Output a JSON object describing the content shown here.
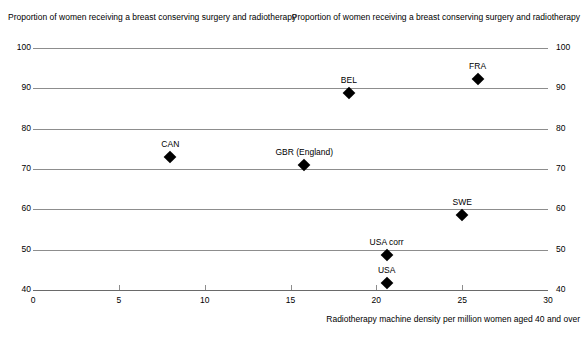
{
  "chart_data": {
    "type": "scatter",
    "title": "",
    "xlabel": "Radiotherapy machine density per million women aged 40 and over",
    "ylabel": "Proportion of women receiving a breast conserving surgery and radiotherapy",
    "ylabel_right": "Proportion of women receiving a breast conserving surgery and radiotherapy",
    "xlim": [
      0,
      30
    ],
    "ylim": [
      40,
      100
    ],
    "xticks": [
      0,
      5,
      10,
      15,
      20,
      25,
      30
    ],
    "xtick_labels": [
      "0",
      "5",
      "10",
      "15",
      "20",
      "25",
      "30"
    ],
    "yticks": [
      40,
      50,
      60,
      70,
      80,
      90,
      100
    ],
    "ytick_labels": [
      "40",
      "50",
      "60",
      "70",
      "80",
      "90",
      "100"
    ],
    "ytick_labels_right": [
      "40",
      "50",
      "60",
      "70",
      "80",
      "90",
      "100"
    ],
    "grid": true,
    "legend": "none",
    "marker_shape": "diamond",
    "marker_color": "#000000",
    "points": [
      {
        "label": "CAN",
        "x": 8.0,
        "y": 73.0
      },
      {
        "label": "BEL",
        "x": 18.4,
        "y": 88.8
      },
      {
        "label": "FRA",
        "x": 25.9,
        "y": 92.3
      },
      {
        "label": "GBR (England)",
        "x": 15.8,
        "y": 71.0
      },
      {
        "label": "SWE",
        "x": 25.0,
        "y": 58.7
      },
      {
        "label": "USA corr",
        "x": 20.6,
        "y": 48.6
      },
      {
        "label": "USA",
        "x": 20.6,
        "y": 41.7
      }
    ]
  }
}
